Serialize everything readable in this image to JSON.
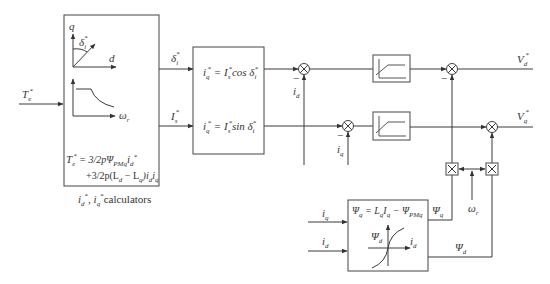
{
  "diagram": {
    "input": {
      "label": "T",
      "sub": "e",
      "sup": "*"
    },
    "calculator_block": {
      "caption": "i_d*, i_q* calculators",
      "caption_parts": {
        "a": "i",
        "a_sub": "d",
        "a_sup": "*",
        "sep": ", ",
        "b": "i",
        "b_sub": "q",
        "b_sup": "*",
        "text": "calculators"
      },
      "vector_plot": {
        "y_axis": "q",
        "x_axis": "d",
        "angle": "δ",
        "angle_sub": "i",
        "angle_sup": "*"
      },
      "curve_plot": {
        "x_axis": "ω",
        "x_sub": "r"
      },
      "equation_line1": {
        "lhs": "T",
        "lhs_sub": "e",
        "lhs_sup": "*",
        "rhs": " = 3/2pΨ",
        "rhs_sub": "PMq",
        "tail": "i",
        "tail_sub": "d",
        "tail_sup": "*"
      },
      "equation_line2": {
        "text": "+3/2p(L",
        "s1": "d",
        "mid": " − L",
        "s2": "q",
        "end": ")i",
        "s3": "d",
        "end2": "i",
        "s4": "q"
      }
    },
    "signals": {
      "delta": {
        "label": "δ",
        "sub": "i",
        "sup": "*"
      },
      "Is": {
        "label": "I",
        "sub": "s",
        "sup": "*"
      },
      "id": {
        "label": "i",
        "sub": "d"
      },
      "iq": {
        "label": "i",
        "sub": "q"
      },
      "Vd": {
        "label": "V",
        "sub": "d",
        "sup": "*"
      },
      "Vq": {
        "label": "V",
        "sub": "q",
        "sup": "*"
      },
      "omega": {
        "label": "ω",
        "sub": "r"
      },
      "psi_q": {
        "label": "Ψ",
        "sub": "q"
      },
      "psi_d": {
        "label": "Ψ",
        "sub": "d"
      },
      "minus": "−"
    },
    "transform_block": {
      "eq1": {
        "lhs": "i",
        "lhs_sub": "q",
        "lhs_sup": "*",
        "mid": " = I",
        "mid_sub": "s",
        "mid_sup": "*",
        "fn": "cos δ",
        "fn_sub": "i",
        "fn_sup": "*"
      },
      "eq2": {
        "lhs": "i",
        "lhs_sub": "q",
        "lhs_sup": "*",
        "mid": " = I",
        "mid_sub": "s",
        "mid_sup": "*",
        "fn": "sin δ",
        "fn_sub": "i",
        "fn_sup": "*"
      }
    },
    "flux_block": {
      "eq": {
        "lhs": "Ψ",
        "lhs_sub": "q",
        "mid": " = L",
        "mid_sub": "q",
        "i": "I",
        "i_sub": "q",
        "minus": " − Ψ",
        "psi_sub": "PMq"
      },
      "plot": {
        "y_axis": "Ψ",
        "y_sub": "d",
        "x_axis": "i",
        "x_sub": "d"
      }
    },
    "blocks": {
      "sum_junction_symbol": "⊗",
      "multiplier_symbol": "×"
    }
  }
}
